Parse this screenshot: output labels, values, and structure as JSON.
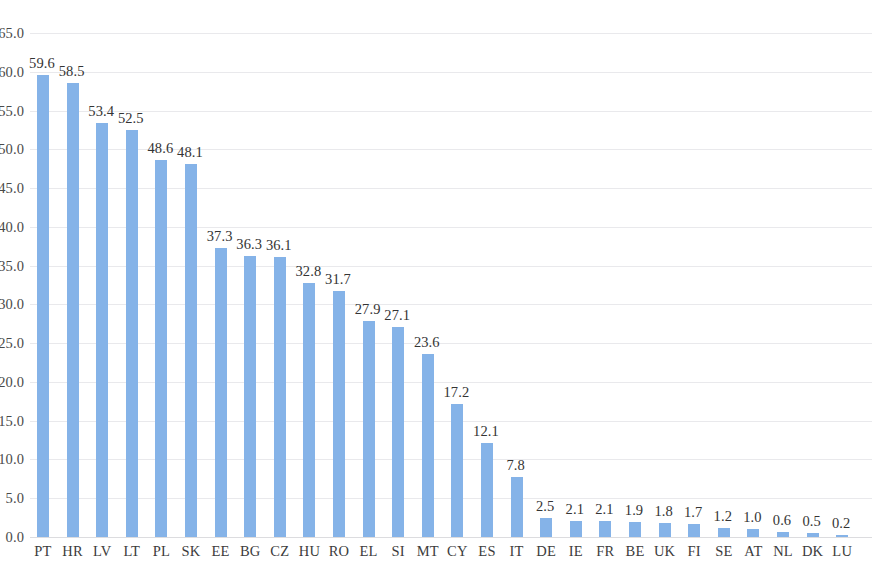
{
  "chart_data": {
    "type": "bar",
    "title": "",
    "subtitle": "",
    "xlabel": "",
    "ylabel": "",
    "ylim": [
      0.0,
      65.0
    ],
    "y_tick_labels": [
      "0.0",
      "5.0",
      "10.0",
      "15.0",
      "20.0",
      "25.0",
      "30.0",
      "35.0",
      "40.0",
      "45.0",
      "50.0",
      "55.0",
      "60.0",
      "65.0"
    ],
    "y_tick_values": [
      0,
      5,
      10,
      15,
      20,
      25,
      30,
      35,
      40,
      45,
      50,
      55,
      60,
      65
    ],
    "grid": true,
    "grid_axis": "y",
    "legend": false,
    "legend_position": "none",
    "bar_color": "#85b3e8",
    "grid_color": "#e9e9ec",
    "text_color": "#3a3a3a",
    "show_data_labels": true,
    "categories": [
      "PT",
      "HR",
      "LV",
      "LT",
      "PL",
      "SK",
      "EE",
      "BG",
      "CZ",
      "HU",
      "RO",
      "EL",
      "SI",
      "MT",
      "CY",
      "ES",
      "IT",
      "DE",
      "IE",
      "FR",
      "BE",
      "UK",
      "FI",
      "SE",
      "AT",
      "NL",
      "DK",
      "LU"
    ],
    "values": [
      59.6,
      58.5,
      53.4,
      52.5,
      48.6,
      48.1,
      37.3,
      36.3,
      36.1,
      32.8,
      31.7,
      27.9,
      27.1,
      23.6,
      17.2,
      12.1,
      7.8,
      2.5,
      2.1,
      2.1,
      1.9,
      1.8,
      1.7,
      1.2,
      1.0,
      0.6,
      0.5,
      0.2
    ],
    "data_labels": [
      "59.6",
      "58.5",
      "53.4",
      "52.5",
      "48.6",
      "48.1",
      "37.3",
      "36.3",
      "36.1",
      "32.8",
      "31.7",
      "27.9",
      "27.1",
      "23.6",
      "17.2",
      "12.1",
      "7.8",
      "2.5",
      "2.1",
      "2.1",
      "1.9",
      "1.8",
      "1.7",
      "1.2",
      "1.0",
      "0.6",
      "0.5",
      "0.2"
    ]
  }
}
